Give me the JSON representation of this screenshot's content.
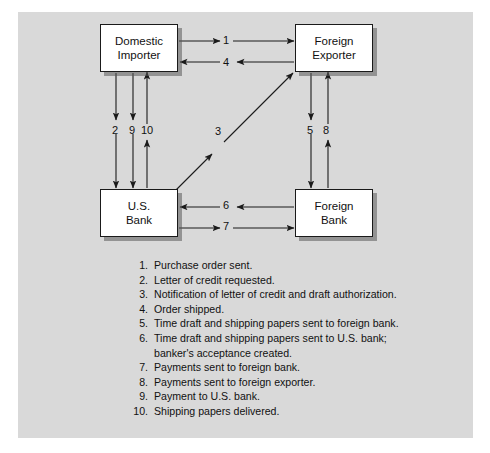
{
  "figure": {
    "background_color": "#d9d9d9",
    "node_fill": "#ffffff",
    "line_color": "#1a1a1a"
  },
  "nodes": {
    "domestic_importer": {
      "line1": "Domestic",
      "line2": "Importer"
    },
    "foreign_exporter": {
      "line1": "Foreign",
      "line2": "Exporter"
    },
    "us_bank": {
      "line1": "U.S.",
      "line2": "Bank"
    },
    "foreign_bank": {
      "line1": "Foreign",
      "line2": "Bank"
    }
  },
  "arrow_labels": {
    "a1": "1",
    "a2": "2",
    "a3": "3",
    "a4": "4",
    "a5": "5",
    "a6": "6",
    "a7": "7",
    "a8": "8",
    "a9": "9",
    "a10": "10"
  },
  "flows": [
    {
      "id": "1",
      "from": "Domestic Importer",
      "to": "Foreign Exporter",
      "direction": "right"
    },
    {
      "id": "2",
      "from": "Domestic Importer",
      "to": "U.S. Bank",
      "direction": "down"
    },
    {
      "id": "3",
      "from": "U.S. Bank",
      "to": "Foreign Exporter",
      "direction": "up-right"
    },
    {
      "id": "4",
      "from": "Foreign Exporter",
      "to": "Domestic Importer",
      "direction": "left"
    },
    {
      "id": "5",
      "from": "Foreign Exporter",
      "to": "Foreign Bank",
      "direction": "down"
    },
    {
      "id": "6",
      "from": "Foreign Bank",
      "to": "U.S. Bank",
      "direction": "left"
    },
    {
      "id": "7",
      "from": "U.S. Bank",
      "to": "Foreign Bank",
      "direction": "right"
    },
    {
      "id": "8",
      "from": "Foreign Bank",
      "to": "Foreign Exporter",
      "direction": "up"
    },
    {
      "id": "9",
      "from": "Domestic Importer",
      "to": "U.S. Bank",
      "direction": "down"
    },
    {
      "id": "10",
      "from": "U.S. Bank",
      "to": "Domestic Importer",
      "direction": "up"
    }
  ],
  "legend": {
    "items": [
      {
        "num": "1.",
        "text": "Purchase order sent."
      },
      {
        "num": "2.",
        "text": "Letter of credit requested."
      },
      {
        "num": "3.",
        "text": "Notification of letter of credit and draft authorization."
      },
      {
        "num": "4.",
        "text": "Order shipped."
      },
      {
        "num": "5.",
        "text": "Time draft and shipping papers sent to foreign bank."
      },
      {
        "num": "6.",
        "text": "Time draft and shipping papers sent to U.S. bank;",
        "cont": "banker's acceptance created."
      },
      {
        "num": "7.",
        "text": "Payments sent to foreign bank."
      },
      {
        "num": "8.",
        "text": "Payments sent to foreign exporter."
      },
      {
        "num": "9.",
        "text": "Payment to U.S. bank."
      },
      {
        "num": "10.",
        "text": "Shipping papers delivered."
      }
    ]
  }
}
